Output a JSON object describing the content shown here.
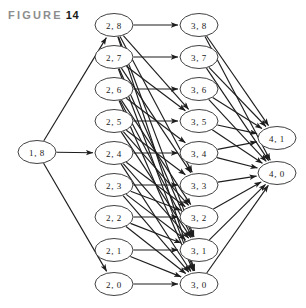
{
  "figure": {
    "prefix": "FIGURE",
    "number": "14"
  },
  "diagram": {
    "type": "directed-graph",
    "node_shape": "ellipse",
    "node_fill": "#ffffff",
    "node_stroke": "#2b2b2b",
    "edge_color": "#1d1d1d",
    "background": "#ffffff",
    "columns": [
      {
        "name": "col-1",
        "x": 37,
        "nodes": [
          "n18"
        ]
      },
      {
        "name": "col-2",
        "x": 114,
        "nodes": [
          "n28",
          "n27",
          "n26",
          "n25",
          "n24",
          "n23",
          "n22",
          "n21",
          "n20"
        ]
      },
      {
        "name": "col-3",
        "x": 199,
        "nodes": [
          "n38",
          "n37",
          "n36",
          "n35",
          "n34",
          "n33",
          "n32",
          "n31",
          "n30"
        ]
      },
      {
        "name": "col-4",
        "x": 277,
        "nodes": [
          "n41",
          "n40"
        ]
      }
    ],
    "nodes": [
      {
        "id": "n18",
        "label": "1, 8",
        "x": 37,
        "y": 152,
        "rx": 19,
        "ry": 11.5
      },
      {
        "id": "n28",
        "label": "2, 8",
        "x": 114,
        "y": 25,
        "rx": 19,
        "ry": 11.5
      },
      {
        "id": "n27",
        "label": "2, 7",
        "x": 114,
        "y": 57,
        "rx": 19,
        "ry": 11.5
      },
      {
        "id": "n26",
        "label": "2, 6",
        "x": 114,
        "y": 89,
        "rx": 19,
        "ry": 11.5
      },
      {
        "id": "n25",
        "label": "2, 5",
        "x": 114,
        "y": 121,
        "rx": 19,
        "ry": 11.5
      },
      {
        "id": "n24",
        "label": "2, 4",
        "x": 114,
        "y": 153,
        "rx": 19,
        "ry": 11.5
      },
      {
        "id": "n23",
        "label": "2, 3",
        "x": 114,
        "y": 185,
        "rx": 19,
        "ry": 11.5
      },
      {
        "id": "n22",
        "label": "2, 2",
        "x": 114,
        "y": 217,
        "rx": 19,
        "ry": 11.5
      },
      {
        "id": "n21",
        "label": "2, 1",
        "x": 114,
        "y": 250,
        "rx": 19,
        "ry": 11.5
      },
      {
        "id": "n20",
        "label": "2, 0",
        "x": 114,
        "y": 284,
        "rx": 19,
        "ry": 11.5
      },
      {
        "id": "n38",
        "label": "3, 8",
        "x": 199,
        "y": 25,
        "rx": 19,
        "ry": 11.5
      },
      {
        "id": "n37",
        "label": "3, 7",
        "x": 199,
        "y": 57,
        "rx": 19,
        "ry": 11.5
      },
      {
        "id": "n36",
        "label": "3, 6",
        "x": 199,
        "y": 89,
        "rx": 19,
        "ry": 11.5
      },
      {
        "id": "n35",
        "label": "3, 5",
        "x": 199,
        "y": 121,
        "rx": 19,
        "ry": 11.5
      },
      {
        "id": "n34",
        "label": "3, 4",
        "x": 199,
        "y": 153,
        "rx": 19,
        "ry": 11.5
      },
      {
        "id": "n33",
        "label": "3, 3",
        "x": 199,
        "y": 185,
        "rx": 19,
        "ry": 11.5
      },
      {
        "id": "n32",
        "label": "3, 2",
        "x": 199,
        "y": 217,
        "rx": 19,
        "ry": 11.5
      },
      {
        "id": "n31",
        "label": "3, 1",
        "x": 199,
        "y": 250,
        "rx": 19,
        "ry": 11.5
      },
      {
        "id": "n30",
        "label": "3, 0",
        "x": 199,
        "y": 284,
        "rx": 19,
        "ry": 11.5
      },
      {
        "id": "n41",
        "label": "4, 1",
        "x": 277,
        "y": 138,
        "rx": 19,
        "ry": 11.5
      },
      {
        "id": "n40",
        "label": "4, 0",
        "x": 277,
        "y": 173,
        "rx": 19,
        "ry": 11.5
      }
    ],
    "edges": [
      {
        "from": "n18",
        "to": "n28"
      },
      {
        "from": "n18",
        "to": "n24"
      },
      {
        "from": "n18",
        "to": "n20"
      },
      {
        "from": "n28",
        "to": "n38"
      },
      {
        "from": "n28",
        "to": "n35"
      },
      {
        "from": "n28",
        "to": "n33"
      },
      {
        "from": "n28",
        "to": "n31"
      },
      {
        "from": "n28",
        "to": "n30"
      },
      {
        "from": "n27",
        "to": "n37"
      },
      {
        "from": "n27",
        "to": "n35"
      },
      {
        "from": "n27",
        "to": "n33"
      },
      {
        "from": "n27",
        "to": "n31"
      },
      {
        "from": "n27",
        "to": "n30"
      },
      {
        "from": "n26",
        "to": "n36"
      },
      {
        "from": "n26",
        "to": "n34"
      },
      {
        "from": "n26",
        "to": "n32"
      },
      {
        "from": "n26",
        "to": "n31"
      },
      {
        "from": "n26",
        "to": "n30"
      },
      {
        "from": "n25",
        "to": "n35"
      },
      {
        "from": "n25",
        "to": "n33"
      },
      {
        "from": "n25",
        "to": "n32"
      },
      {
        "from": "n25",
        "to": "n31"
      },
      {
        "from": "n24",
        "to": "n34"
      },
      {
        "from": "n24",
        "to": "n32"
      },
      {
        "from": "n24",
        "to": "n31"
      },
      {
        "from": "n24",
        "to": "n30"
      },
      {
        "from": "n23",
        "to": "n33"
      },
      {
        "from": "n23",
        "to": "n32"
      },
      {
        "from": "n23",
        "to": "n31"
      },
      {
        "from": "n23",
        "to": "n30"
      },
      {
        "from": "n22",
        "to": "n32"
      },
      {
        "from": "n22",
        "to": "n31"
      },
      {
        "from": "n22",
        "to": "n30"
      },
      {
        "from": "n21",
        "to": "n31"
      },
      {
        "from": "n21",
        "to": "n30"
      },
      {
        "from": "n20",
        "to": "n30"
      },
      {
        "from": "n38",
        "to": "n41"
      },
      {
        "from": "n38",
        "to": "n40"
      },
      {
        "from": "n37",
        "to": "n41"
      },
      {
        "from": "n37",
        "to": "n40"
      },
      {
        "from": "n36",
        "to": "n41"
      },
      {
        "from": "n36",
        "to": "n40"
      },
      {
        "from": "n35",
        "to": "n41"
      },
      {
        "from": "n35",
        "to": "n40"
      },
      {
        "from": "n34",
        "to": "n41"
      },
      {
        "from": "n34",
        "to": "n40"
      },
      {
        "from": "n33",
        "to": "n40"
      },
      {
        "from": "n32",
        "to": "n40"
      },
      {
        "from": "n31",
        "to": "n40"
      },
      {
        "from": "n30",
        "to": "n40"
      }
    ]
  }
}
